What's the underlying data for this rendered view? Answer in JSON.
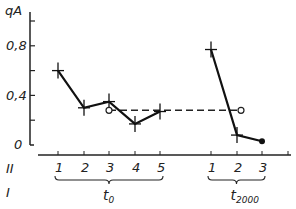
{
  "chart_data": {
    "type": "line",
    "title": "",
    "ylabel": "qA",
    "xlabel": "",
    "ylim": [
      0,
      1.0
    ],
    "yticks": [
      "0",
      "0,4",
      "0,8"
    ],
    "row_labels": {
      "II": "II",
      "I": "I"
    },
    "groups": [
      {
        "name": "t0",
        "label": "t",
        "sub": "0",
        "categories": [
          "1",
          "2",
          "3",
          "4",
          "5"
        ],
        "values": [
          0.6,
          0.3,
          0.35,
          0.17,
          0.27
        ]
      },
      {
        "name": "t2000",
        "label": "t",
        "sub": "2000",
        "categories": [
          "1",
          "2",
          "3"
        ],
        "values": [
          0.77,
          0.08,
          0.03
        ]
      }
    ],
    "reference_line": {
      "style": "dashed",
      "value": 0.28,
      "from": "t0-3",
      "to": "t2000-2",
      "markers": "open-circle"
    },
    "grid": false
  }
}
